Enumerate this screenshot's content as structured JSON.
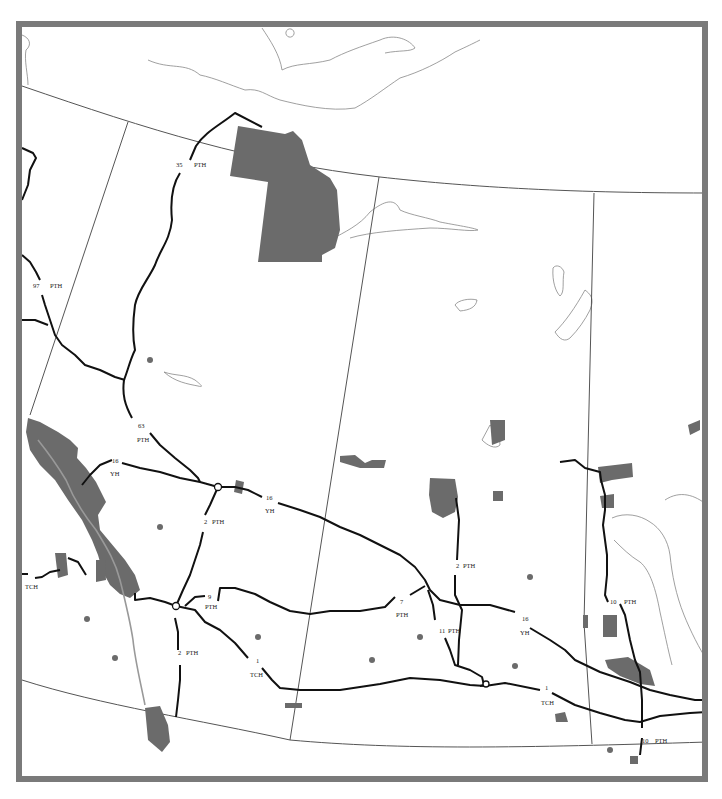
{
  "map": {
    "highway_labels": [
      {
        "id": "h35",
        "num": "35",
        "type": "PTH",
        "x": 176,
        "y": 167,
        "tx": 194,
        "ty": 167
      },
      {
        "id": "h97",
        "num": "97",
        "type": "PTH",
        "x": 33,
        "y": 288,
        "tx": 50,
        "ty": 288
      },
      {
        "id": "h63",
        "num": "63",
        "type": "PTH",
        "x": 138,
        "y": 428,
        "tx": 137,
        "ty": 442
      },
      {
        "id": "h16a",
        "num": "16",
        "type": "YH",
        "x": 112,
        "y": 463,
        "tx": 110,
        "ty": 476
      },
      {
        "id": "h16b",
        "num": "16",
        "type": "YH",
        "x": 266,
        "y": 500,
        "tx": 265,
        "ty": 513
      },
      {
        "id": "h2a",
        "num": "2",
        "type": "PTH",
        "x": 204,
        "y": 524,
        "tx": 212,
        "ty": 524
      },
      {
        "id": "h2b",
        "num": "2",
        "type": "PTH",
        "x": 178,
        "y": 655,
        "tx": 186,
        "ty": 655
      },
      {
        "id": "h2c",
        "num": "2",
        "type": "PTH",
        "x": 456,
        "y": 568,
        "tx": 463,
        "ty": 568
      },
      {
        "id": "h9",
        "num": "9",
        "type": "PTH",
        "x": 208,
        "y": 599,
        "tx": 205,
        "ty": 609
      },
      {
        "id": "h7",
        "num": "7",
        "type": "PTH",
        "x": 400,
        "y": 604,
        "tx": 396,
        "ty": 617
      },
      {
        "id": "h11",
        "num": "11",
        "type": "PTH",
        "x": 439,
        "y": 633,
        "tx": 448,
        "ty": 633
      },
      {
        "id": "h16c",
        "num": "16",
        "type": "YH",
        "x": 522,
        "y": 621,
        "tx": 520,
        "ty": 635
      },
      {
        "id": "h10a",
        "num": "10",
        "type": "PTH",
        "x": 610,
        "y": 604,
        "tx": 624,
        "ty": 604
      },
      {
        "id": "h1a",
        "num": "1",
        "type": "TCH",
        "x": 256,
        "y": 663,
        "tx": 250,
        "ty": 677
      },
      {
        "id": "h1b",
        "num": "1",
        "type": "TCH",
        "x": 545,
        "y": 690,
        "tx": 541,
        "ty": 705
      },
      {
        "id": "h10b",
        "num": "10",
        "type": "PTH",
        "x": 642,
        "y": 743,
        "tx": 655,
        "ty": 743
      },
      {
        "id": "hTCHw",
        "num": "",
        "type": "TCH",
        "x": 0,
        "y": 0,
        "tx": 25,
        "ty": 589
      }
    ],
    "colors": {
      "frame": "#7a7a7a",
      "park": "#6b6b6b",
      "road": "#111111",
      "boundary": "#555555",
      "coast": "#888888"
    }
  }
}
